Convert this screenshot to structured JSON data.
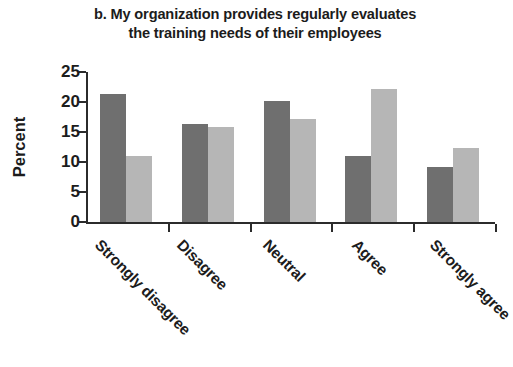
{
  "chart_data": {
    "type": "bar",
    "title": "b. My organization provides regularly evaluates the training needs of their employees",
    "title_lines": [
      "b. My organization provides regularly evaluates",
      "the training needs of their employees"
    ],
    "xlabel": "",
    "ylabel": "Percent",
    "categories": [
      "Strongly disagree",
      "Disagree",
      "Neutral",
      "Agree",
      "Strongly agree"
    ],
    "series": [
      {
        "name": "Series 1",
        "color": "#6f6f6f",
        "values": [
          21.3,
          16.3,
          20.1,
          11.0,
          9.2
        ]
      },
      {
        "name": "Series 2",
        "color": "#b6b6b6",
        "values": [
          11.0,
          15.8,
          17.2,
          22.1,
          12.4
        ]
      }
    ],
    "ylim": [
      0,
      25
    ],
    "yticks": [
      0,
      5,
      10,
      15,
      20,
      25
    ],
    "ytick_labels": [
      "0",
      "5",
      "10",
      "15",
      "20",
      "25"
    ],
    "grid": false,
    "legend": "none",
    "axis_color": "#2b2b2b",
    "background": "#ffffff"
  }
}
